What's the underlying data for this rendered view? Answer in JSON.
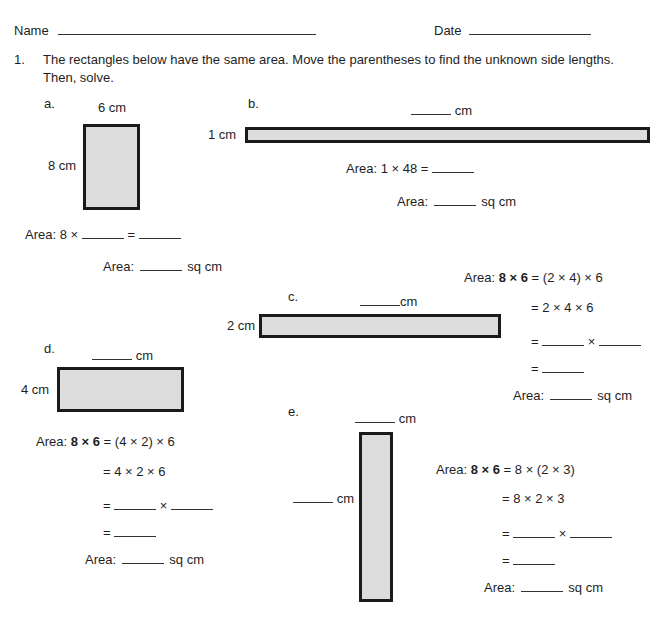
{
  "header": {
    "name_label": "Name",
    "date_label": "Date"
  },
  "problem": {
    "number": "1.",
    "instruction_line1": "The rectangles below have the same area.  Move the parentheses to find the unknown side lengths.",
    "instruction_line2": "Then, solve."
  },
  "colors": {
    "rect_fill": "#dcdcdc",
    "rect_border": "#1a1a1a"
  },
  "parts": {
    "a": {
      "label": "a.",
      "top_side": "6 cm",
      "left_side": "8 cm",
      "area_eq_prefix": "Area:  8 ×",
      "area_eq_equals": "=",
      "area_label": "Area:",
      "unit": "sq cm"
    },
    "b": {
      "label": "b.",
      "top_unit": "cm",
      "left_side": "1 cm",
      "area_eq": "Area:  1 × 48 =",
      "area_label": "Area:",
      "unit": "sq cm"
    },
    "c": {
      "label": "c.",
      "top_unit": "cm",
      "left_side": "2 cm",
      "area_prefix": "Area:",
      "bold_expr": "8 × 6",
      "line1_rest": "= (2 × 4) × 6",
      "line2": "= 2 × 4 × 6",
      "eq_sign": "=",
      "times": "×",
      "area_label": "Area:",
      "unit": "sq cm"
    },
    "d": {
      "label": "d.",
      "top_unit": "cm",
      "left_side": "4 cm",
      "area_prefix": "Area:",
      "bold_expr": "8 × 6",
      "line1_rest": "= (4 × 2) × 6",
      "line2": "= 4 × 2 × 6",
      "eq_sign": "=",
      "times": "×",
      "area_label": "Area:",
      "unit": "sq cm"
    },
    "e": {
      "label": "e.",
      "top_unit": "cm",
      "left_unit": "cm",
      "area_prefix": "Area:",
      "bold_expr": "8 × 6",
      "line1_rest": "= 8 × (2 × 3)",
      "line2": "= 8 × 2 × 3",
      "eq_sign": "=",
      "times": "×",
      "area_label": "Area:",
      "unit": "sq cm"
    }
  }
}
